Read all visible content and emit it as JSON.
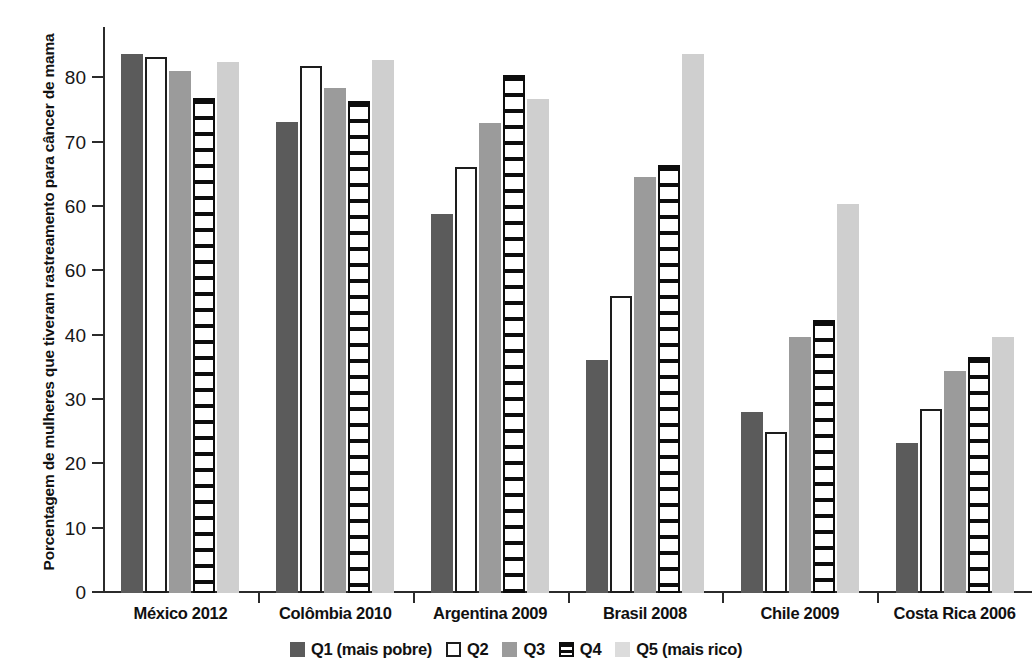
{
  "chart_data": {
    "type": "bar",
    "title": "",
    "subtitle": "",
    "xlabel": "",
    "ylabel": "Porcentagem de mulheres que tiveram rastreamento para câncer de mama",
    "ylim": [
      0,
      88
    ],
    "ytick_values": [
      0,
      10,
      20,
      30,
      40,
      50,
      60,
      70,
      80
    ],
    "ytick_labels": [
      "0",
      "10",
      "20",
      "30",
      "40",
      "60",
      "60",
      "70",
      "80"
    ],
    "grid": false,
    "legend_position": "bottom",
    "categories": [
      "México 2012",
      "Colômbia 2010",
      "Argentina 2009",
      "Brasil 2008",
      "Chile 2009",
      "Costa Rica 2006"
    ],
    "series": [
      {
        "name": "Q1 (mais pobre)",
        "key": "q1",
        "color": "#5b5b5b",
        "values": [
          83.8,
          73.3,
          58.9,
          36.3,
          28.2,
          23.3
        ]
      },
      {
        "name": "Q2",
        "key": "q2",
        "color": "#ffffff",
        "values": [
          83.4,
          82.0,
          66.2,
          46.2,
          25.0,
          28.6
        ]
      },
      {
        "name": "Q3",
        "key": "q3",
        "color": "#9b9b9b",
        "values": [
          81.2,
          78.5,
          73.0,
          64.7,
          39.8,
          34.5
        ]
      },
      {
        "name": "Q4",
        "key": "q4",
        "color": "#0d0d0d",
        "values": [
          76.9,
          76.5,
          80.5,
          66.5,
          42.5,
          36.7
        ]
      },
      {
        "name": "Q5 (mais rico)",
        "key": "q5",
        "color": "#cfcfcf",
        "values": [
          82.5,
          82.8,
          76.8,
          83.8,
          60.5,
          39.8
        ]
      }
    ]
  },
  "legend": {
    "items": [
      {
        "label": "Q1 (mais pobre)",
        "key": "q1"
      },
      {
        "label": "Q2",
        "key": "q2"
      },
      {
        "label": "Q3",
        "key": "q3"
      },
      {
        "label": "Q4",
        "key": "q4"
      },
      {
        "label": "Q5 (mais rico)",
        "key": "q5"
      }
    ]
  }
}
